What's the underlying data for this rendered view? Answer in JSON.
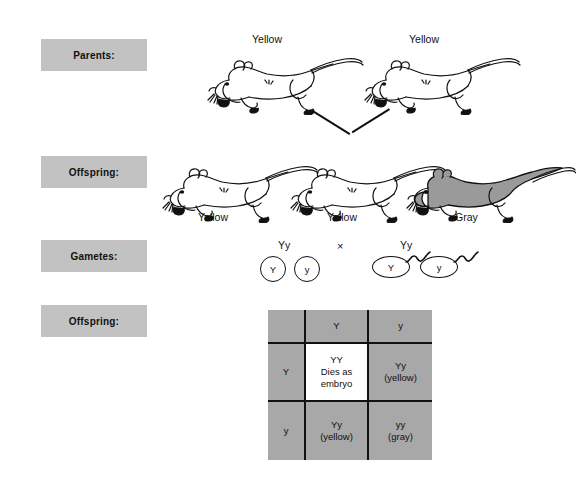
{
  "diagram": {
    "row_labels": [
      {
        "name": "parents",
        "text": "Parents:"
      },
      {
        "name": "offspring-phenotypes",
        "text": "Offspring:"
      },
      {
        "name": "gametes",
        "text": "Gametes:"
      },
      {
        "name": "offspring-punnett",
        "text": "Offspring:"
      }
    ],
    "parents": [
      {
        "phenotype": "Yellow",
        "fill": "white"
      },
      {
        "phenotype": "Yellow",
        "fill": "white"
      }
    ],
    "offspring": [
      {
        "phenotype": "Yellow",
        "fill": "white"
      },
      {
        "phenotype": "Yellow",
        "fill": "white"
      },
      {
        "phenotype": "Gray",
        "fill": "gray"
      }
    ],
    "gametes": {
      "maternal_genotype": "Yy",
      "paternal_genotype": "Yy",
      "cross_symbol": "×",
      "eggs": [
        {
          "allele": "Y"
        },
        {
          "allele": "y"
        }
      ],
      "sperm": [
        {
          "allele": "Y"
        },
        {
          "allele": "y"
        }
      ]
    },
    "punnett": {
      "corner": "",
      "column_headers": [
        "Y",
        "y"
      ],
      "row_headers": [
        "Y",
        "y"
      ],
      "cells": [
        {
          "genotype": "YY",
          "note_line1": "Dies as",
          "note_line2": "embryo",
          "phenotype": "",
          "background": "white"
        },
        {
          "genotype": "Yy",
          "note_line1": "",
          "note_line2": "",
          "phenotype": "(yellow)",
          "background": "gray"
        },
        {
          "genotype": "Yy",
          "note_line1": "",
          "note_line2": "",
          "phenotype": "(yellow)",
          "background": "gray"
        },
        {
          "genotype": "yy",
          "note_line1": "",
          "note_line2": "",
          "phenotype": "(gray)",
          "background": "gray"
        }
      ]
    },
    "colors": {
      "label_box": "#c2c2c2",
      "punnett_gray": "#a8a8a8",
      "gray_mouse": "#9a9a9a",
      "ink": "#111111"
    }
  }
}
